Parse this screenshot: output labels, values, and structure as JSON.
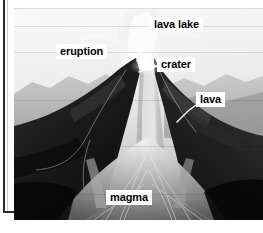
{
  "figure": {
    "kind": "volcano-cross-section-photo-diagram",
    "width": 263,
    "height": 233,
    "palette": {
      "label_background": "#ffffff",
      "label_text": "#000000",
      "leader_line": "#ffffff",
      "frame_rule": "#2a2a2a",
      "page_background": "#ffffff",
      "sky_light": "#f2f2f2",
      "sky_mid": "#c8c8c8",
      "ridge_far": "#9a9a9a",
      "cone_dark": "#161616",
      "cone_mid": "#3a3a3a",
      "plume_white": "#fdfdfd",
      "magma_bright": "#d8d8d8"
    }
  },
  "labels": [
    {
      "id": "lava-lake",
      "text": "lava lake",
      "x": 150,
      "y": 17
    },
    {
      "id": "eruption",
      "text": "eruption",
      "x": 56,
      "y": 44
    },
    {
      "id": "crater",
      "text": "crater",
      "x": 157,
      "y": 57
    },
    {
      "id": "lava",
      "text": "lava",
      "x": 196,
      "y": 92
    },
    {
      "id": "magma",
      "text": "magma",
      "x": 106,
      "y": 190
    }
  ],
  "leader_lines": [
    {
      "id": "lava-lake-leader",
      "from_label": "lava lake",
      "points": "150,32 143,44 137,61"
    },
    {
      "id": "crater-leader",
      "from_label": "crater",
      "points": "157,66 146,69 139,72"
    },
    {
      "id": "lava-leader",
      "from_label": "lava",
      "points": "196,105 188,111 177,122"
    }
  ]
}
